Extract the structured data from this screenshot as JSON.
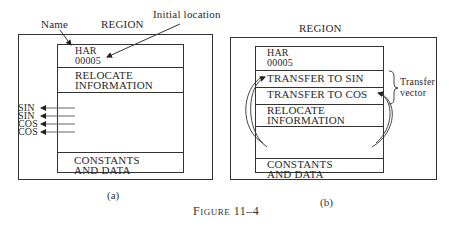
{
  "figure": {
    "caption_prefix": "F",
    "caption_smallcaps": "IGURE",
    "caption_number": "11–4"
  },
  "panel_a": {
    "label": "(a)",
    "region_label": "REGION",
    "name_label": "Name",
    "initial_location_label": "Initial location",
    "rows": {
      "har": "HAR",
      "har_value": "00005",
      "relocate_1": "RELOCATE",
      "relocate_2": "INFORMATION",
      "constants_1": "CONSTANTS",
      "constants_2": "AND DATA"
    },
    "external_refs": [
      "SIN",
      "SIN",
      "COS",
      "COS"
    ]
  },
  "panel_b": {
    "label": "(b)",
    "region_label": "REGION",
    "rows": {
      "har": "HAR",
      "har_value": "00005",
      "transfer_sin": "TRANSFER TO SIN",
      "transfer_cos": "TRANSFER TO COS",
      "relocate_1": "RELOCATE",
      "relocate_2": "INFORMATION",
      "constants_1": "CONSTANTS",
      "constants_2": "AND DATA"
    },
    "transfer_vector_label_1": "Transfer",
    "transfer_vector_label_2": "vector"
  }
}
